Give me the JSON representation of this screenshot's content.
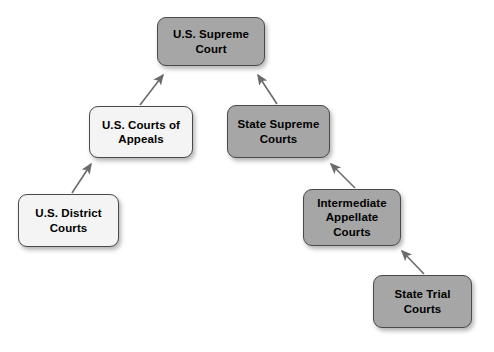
{
  "diagram": {
    "canvas": {
      "width": 494,
      "height": 352,
      "background": "#ffffff"
    },
    "colors": {
      "federal_fill": "#f4f4f4",
      "state_fill": "#a6a6a6",
      "border": "#4a4a4a",
      "text": "#000000",
      "arrow": "#6b6b6b"
    },
    "nodes": [
      {
        "id": "us-supreme-court",
        "label": "U.S. Supreme Court",
        "line1": "U.S. Supreme",
        "line2": "Court",
        "fill": "#a6a6a6",
        "x": 157,
        "y": 17,
        "w": 108,
        "h": 49
      },
      {
        "id": "us-courts-of-appeals",
        "label": "U.S. Courts of Appeals",
        "line1": "U.S. Courts of",
        "line2": "Appeals",
        "fill": "#f4f4f4",
        "x": 89,
        "y": 106,
        "w": 104,
        "h": 52
      },
      {
        "id": "state-supreme-courts",
        "label": "State Supreme Courts",
        "line1": "State Supreme",
        "line2": "Courts",
        "fill": "#a6a6a6",
        "x": 227,
        "y": 105,
        "w": 103,
        "h": 53
      },
      {
        "id": "us-district-courts",
        "label": "U.S. District Courts",
        "line1": "U.S. District",
        "line2": "Courts",
        "fill": "#f4f4f4",
        "x": 18,
        "y": 194,
        "w": 101,
        "h": 53
      },
      {
        "id": "intermediate-appellate-courts",
        "label": "Intermediate Appellate Courts",
        "line1": "Intermediate",
        "line2": "Appellate",
        "line3": "Courts",
        "fill": "#a6a6a6",
        "x": 303,
        "y": 189,
        "w": 98,
        "h": 57
      },
      {
        "id": "state-trial-courts",
        "label": "State Trial Courts",
        "line1": "State Trial",
        "line2": "Courts",
        "fill": "#a6a6a6",
        "x": 373,
        "y": 275,
        "w": 99,
        "h": 53
      }
    ],
    "edges": [
      {
        "id": "appeals-to-supreme",
        "from": "us-courts-of-appeals",
        "to": "us-supreme-court",
        "direction": "up-right",
        "x1": 140,
        "y1": 105,
        "x2": 163,
        "y2": 75
      },
      {
        "id": "state-supreme-to-us-supreme",
        "from": "state-supreme-courts",
        "to": "us-supreme-court",
        "direction": "up-left",
        "x1": 277,
        "y1": 104,
        "x2": 258,
        "y2": 75
      },
      {
        "id": "district-to-appeals",
        "from": "us-district-courts",
        "to": "us-courts-of-appeals",
        "direction": "up-right",
        "x1": 72,
        "y1": 193,
        "x2": 91,
        "y2": 164
      },
      {
        "id": "intermediate-to-state-supreme",
        "from": "intermediate-appellate-courts",
        "to": "state-supreme-courts",
        "direction": "up-left",
        "x1": 355,
        "y1": 188,
        "x2": 331,
        "y2": 164
      },
      {
        "id": "trial-to-intermediate",
        "from": "state-trial-courts",
        "to": "intermediate-appellate-courts",
        "direction": "up-left",
        "x1": 424,
        "y1": 274,
        "x2": 402,
        "y2": 251
      }
    ]
  }
}
